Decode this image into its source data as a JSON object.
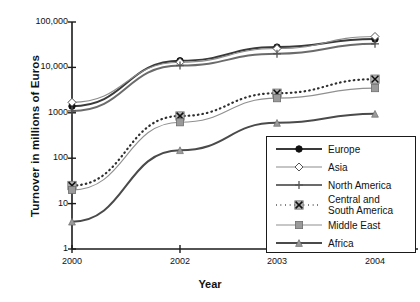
{
  "chart_data": {
    "type": "line",
    "title": "",
    "xlabel": "Year",
    "ylabel": "Turnover in millions of Euros",
    "x": [
      "2000",
      "2002",
      "2003",
      "2004"
    ],
    "categories": [
      "2000",
      "2002",
      "2003",
      "2004"
    ],
    "yscale": "log",
    "ylim": [
      1,
      100000
    ],
    "yticks": [
      "1",
      "10",
      "100",
      "1000",
      "10,000",
      "100,000"
    ],
    "ytick_values": [
      1,
      10,
      100,
      1000,
      10000,
      100000
    ],
    "grid": false,
    "legend_position": "lower right inside",
    "series": [
      {
        "name": "Europe",
        "marker": "filled-circle",
        "line": "solid",
        "color": "#3a3a3a",
        "values": [
          1400,
          14000,
          28000,
          42000
        ]
      },
      {
        "name": "Asia",
        "marker": "open-diamond",
        "line": "solid",
        "color": "#8c8c8c",
        "values": [
          1700,
          13000,
          26000,
          48000
        ]
      },
      {
        "name": "North America",
        "marker": "plus",
        "line": "solid",
        "color": "#6b6b6b",
        "values": [
          1100,
          11000,
          20000,
          33000
        ]
      },
      {
        "name": "Central and\nSouth America",
        "marker": "boxed-x",
        "line": "dotted",
        "color": "#2e2e2e",
        "values": [
          25,
          850,
          2700,
          5500
        ]
      },
      {
        "name": "Middle East",
        "marker": "filled-square",
        "line": "solid",
        "color": "#909090",
        "values": [
          20,
          620,
          2100,
          3500
        ]
      },
      {
        "name": "Africa",
        "marker": "small-triangle",
        "line": "solid",
        "color": "#4a4a4a",
        "values": [
          4,
          150,
          600,
          950
        ]
      }
    ]
  },
  "axis": {
    "y_title": "Turnover in millions of Euros",
    "x_title": "Year",
    "y_tick_labels": [
      "100,000",
      "10,000",
      "1000",
      "100",
      "10",
      "1"
    ],
    "x_tick_labels": [
      "2000",
      "2002",
      "2003",
      "2004"
    ]
  },
  "legend": {
    "items": [
      {
        "label": "Europe"
      },
      {
        "label": "Asia"
      },
      {
        "label": "North America"
      },
      {
        "label": "Central and\nSouth America"
      },
      {
        "label": "Middle East"
      },
      {
        "label": "Africa"
      }
    ]
  }
}
